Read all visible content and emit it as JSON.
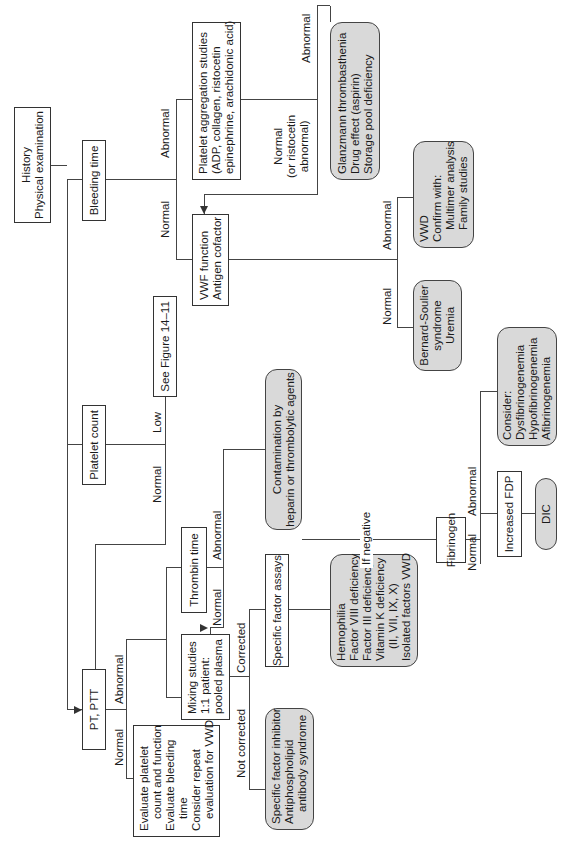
{
  "diagram": {
    "orientation": "rotated -90deg (reads bottom-to-top)",
    "nodes": {
      "history": {
        "lines": [
          "History",
          "Physical examination"
        ]
      },
      "bleeding_time": {
        "lines": [
          "Bleeding time"
        ]
      },
      "platelet_count": {
        "lines": [
          "Platelet count"
        ]
      },
      "pt_ptt": {
        "lines": [
          "PT, PTT"
        ]
      },
      "platelet_aggregation": {
        "lines": [
          "Platelet aggregation studies",
          "(ADP, collagen, ristocetin",
          "epinephrine, arachidonic acid)"
        ]
      },
      "vwf_function": {
        "lines": [
          "VWF function",
          "Antigen cofactor"
        ]
      },
      "see_figure": {
        "lines": [
          "See Figure 14–11"
        ]
      },
      "glanzmann": {
        "lines": [
          "Glanzmann thrombasthenia",
          "Drug effect (aspirin)",
          "Storage pool deficiency"
        ]
      },
      "vwd": {
        "lines": [
          "VWD",
          "Confirm with:",
          "Multimer analysis",
          "Family studies"
        ]
      },
      "bernard_soulier": {
        "lines": [
          "Bernard-Soulier",
          "syndrome",
          "Uremia"
        ]
      },
      "contamination": {
        "lines": [
          "Contamination by",
          "heparin or thrombolytic agents"
        ]
      },
      "thrombin_time": {
        "lines": [
          "Thrombin time"
        ]
      },
      "mixing_studies": {
        "lines": [
          "Mixing studies",
          "1:1 patient:",
          "pooled plasma"
        ]
      },
      "specific_factor_assays": {
        "lines": [
          "Specific factor assays"
        ]
      },
      "hemophilia": {
        "lines": [
          "Hemophilia",
          "Factor VIII deficiency",
          "Factor III deficiency",
          "Vitamin K deficiency",
          "(II, VII, IX, X)",
          "Isolated factors VWD"
        ]
      },
      "specific_factor_inhibitor": {
        "lines": [
          "Specific factor inhibitor",
          "Antiphospholipid",
          "antibody syndrome"
        ]
      },
      "evaluate_platelet": {
        "lines": [
          "Evaluate platelet",
          "count and function",
          "Evaluate bleeding",
          "time",
          "Consider repeat",
          "evaluation for VWD"
        ]
      },
      "fibrinogen": {
        "lines": [
          "Fibrinogen"
        ]
      },
      "consider_fibrinogen": {
        "lines": [
          "Consider:",
          "Dysfibrinogenemia",
          "Hypofibrinogenemia",
          "Afibrinogenemia"
        ]
      },
      "increased_fdp": {
        "lines": [
          "Increased FDP"
        ]
      },
      "dic": {
        "lines": [
          "DIC"
        ]
      }
    },
    "edge_labels": {
      "bt_abnormal": "Abnormal",
      "bt_normal": "Normal",
      "pa_abnormal": "Abnormal",
      "pa_normal": [
        "Normal",
        "(or ristocetin",
        "abnormal)"
      ],
      "vwf_abnormal": "Abnormal",
      "vwf_normal": "Normal",
      "pc_low": "Low",
      "pc_normal": "Normal",
      "pt_abnormal": "Abnormal",
      "pt_normal": "Normal",
      "tt_abnormal": "Abnormal",
      "tt_normal": "Normal",
      "mix_corrected": "Corrected",
      "mix_not_corrected": "Not corrected",
      "if_negative": "If negative",
      "fib_abnormal": "Abnormal",
      "fib_normal": "Normal"
    }
  }
}
